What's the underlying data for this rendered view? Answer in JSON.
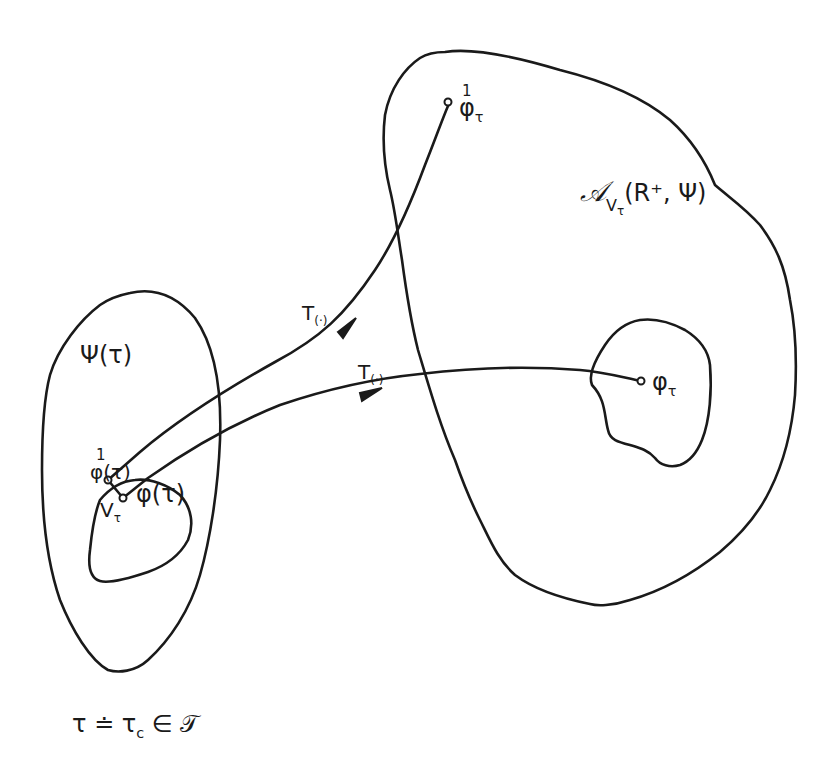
{
  "diagram": {
    "colors": {
      "ink": "#1a1a1a",
      "background": "#ffffff"
    },
    "regions": {
      "left_set": {
        "label": "Ψ(τ)"
      },
      "left_inner": {
        "label_point": "V",
        "label_point_sub": "τ"
      },
      "right_set": {
        "label_main": "𝒜",
        "label_sub": "V",
        "label_sub_sub": "τ",
        "label_args": "(R⁺, Ψ)"
      },
      "right_inner": {
        "label": "φ",
        "label_sub": "τ"
      }
    },
    "points": {
      "phi_one_tau_start": {
        "sup": "1",
        "label": "φ(τ)"
      },
      "phi_tau_start": {
        "label": "φ(τ)"
      },
      "phi_one_end": {
        "sup": "1",
        "label": "φ",
        "sub": "τ"
      }
    },
    "arrows": [
      {
        "label": "T",
        "label_sub": "(·)"
      },
      {
        "label": "T",
        "label_sub": "(·)"
      }
    ],
    "caption": {
      "text_a": "τ ≐ τ",
      "sub": "c",
      "text_b": " ∈ 𝒯"
    }
  }
}
